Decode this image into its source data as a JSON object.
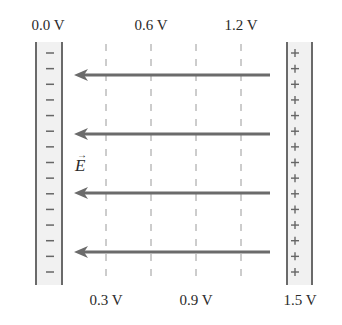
{
  "diagram": {
    "colors": {
      "plate_line": "#6a6a6a",
      "plate_fill": "#f1f1f1",
      "arrow": "#6b6b6b",
      "dash": "#9a9a9a",
      "text": "#2a2a2a"
    },
    "left_plate": {
      "label": "0.0 V",
      "charge_sign": "−",
      "sign_count": 15
    },
    "right_plate": {
      "label": "1.5 V",
      "charge_sign": "+",
      "sign_count": 15
    },
    "equipotentials": [
      {
        "label": "0.3 V",
        "position": "bottom"
      },
      {
        "label": "0.6 V",
        "position": "top"
      },
      {
        "label": "0.9 V",
        "position": "bottom"
      },
      {
        "label": "1.2 V",
        "position": "top"
      }
    ],
    "field": {
      "label": "E",
      "vector_mark": "→",
      "direction": "left",
      "arrow_count": 4
    }
  }
}
